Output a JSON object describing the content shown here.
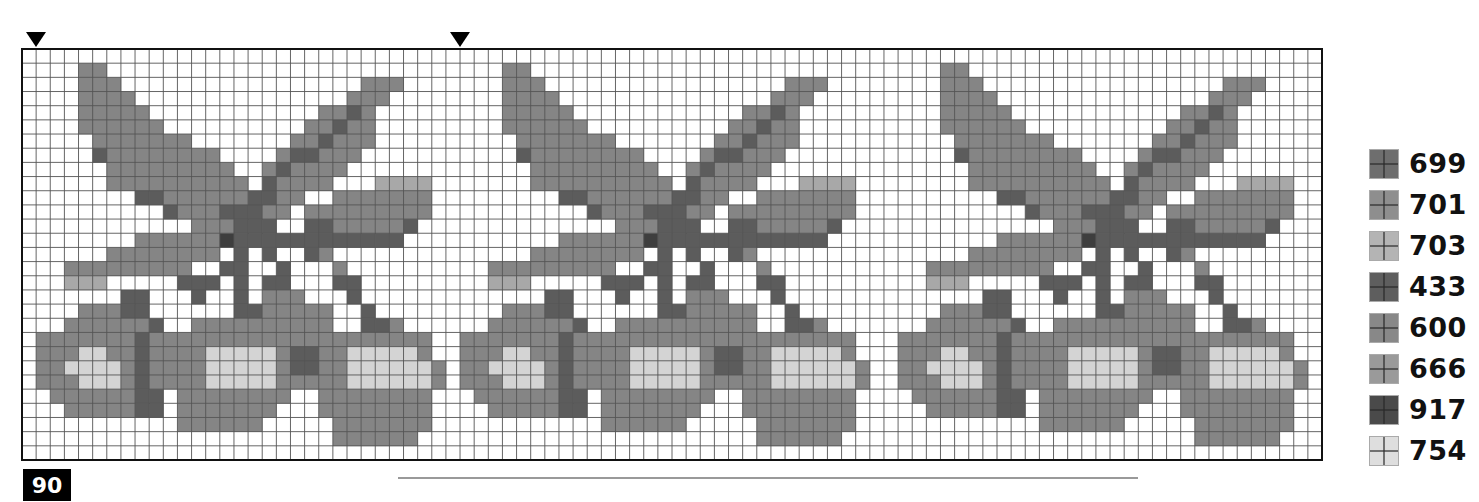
{
  "chart_data": {
    "type": "heatmap",
    "title": "",
    "grid": {
      "columns": 92,
      "rows": 29,
      "cell_px": 14.1,
      "left": 22,
      "top": 49,
      "right": 1322,
      "bottom": 460
    },
    "repeat_count": 3,
    "repeat_offsets_col": [
      0,
      30,
      61
    ],
    "center_markers_col": [
      0,
      30
    ],
    "legend": [
      {
        "code": "699",
        "color": "#6e6e6e"
      },
      {
        "code": "701",
        "color": "#8e8e8e"
      },
      {
        "code": "703",
        "color": "#b4b4b4"
      },
      {
        "code": "433",
        "color": "#5e5e5e"
      },
      {
        "code": "600",
        "color": "#888888"
      },
      {
        "code": "666",
        "color": "#9a9a9a"
      },
      {
        "code": "917",
        "color": "#4a4a4a"
      },
      {
        "code": "754",
        "color": "#dedede"
      }
    ],
    "shade_key": {
      "k": "#3e3e3e",
      "d": "#5c5c5c",
      "m": "#858585",
      "l": "#a8a8a8",
      "p": "#d4d4d4"
    },
    "motif_rows": [
      "...............................",
      "....mm.........................",
      "....mmm.................mmm....",
      "....mmmm...............mmm.....",
      "....mmmmm............mmdm......",
      "....mmmmmm..........mmdmm......",
      ".....mmmmmmm.......mmdmmm......",
      ".....dmmmmmmmm....mddmmm.......",
      "......mmmmmmmmm..mdmmmm........",
      "......mmmmmmmmmm.dmmmm...llll..",
      "........ddmmmmmmddmm..mmmmmmm..",
      "..........dmmmdddmm.mmmmmmmmm..",
      "............mmmddd..ddmmmmmd...",
      "........mmmmmmkdddddddddddd....",
      "......mmmmmmmm.d.d..dm.........",
      "...mmmmmmmmm..dd..d...m........",
      "...lll.....ddd.d.dd...dd.......",
      ".......dd...d..d.mmm...d.......",
      "....mmmdd......ddmmmmm..d......",
      "...mmmmmmd..mmmmmmmmmm..ddm....",
      ".mmmmmmmdmmmmmmmmmmmmmmmmmmmm..",
      ".mmmppmmdmmmmpppppmddmmpppppm..",
      ".mmppppmdmmmmpppppmddmmppppppm.",
      ".mmmpppmdmmmmpppppmmmmmppppppm.",
      "..mmmmmmdd.mmmmmmmm..mmmmmmmm..",
      "...mmmmmdd.mmmmmmm...mmmmmmmm..",
      "...........mmmmmm.....mmmmmmm..",
      "......................mmmmmm...",
      "..............................."
    ]
  },
  "legend": {
    "items": [
      {
        "code": "699",
        "color": "#6e6e6e"
      },
      {
        "code": "701",
        "color": "#8e8e8e"
      },
      {
        "code": "703",
        "color": "#b4b4b4"
      },
      {
        "code": "433",
        "color": "#5e5e5e"
      },
      {
        "code": "600",
        "color": "#888888"
      },
      {
        "code": "666",
        "color": "#9a9a9a"
      },
      {
        "code": "917",
        "color": "#4a4a4a"
      },
      {
        "code": "754",
        "color": "#dedede"
      }
    ]
  },
  "page": {
    "number": "90"
  },
  "markers": [
    {
      "icon": "triangle-down-icon",
      "x": 26
    },
    {
      "icon": "triangle-down-icon",
      "x": 450
    }
  ]
}
